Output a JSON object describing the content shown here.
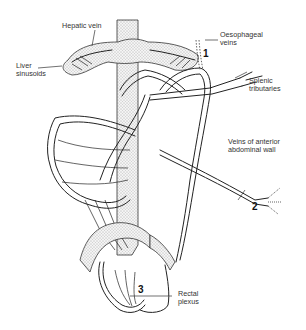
{
  "figure": {
    "labels": {
      "hepatic_vein": "Hepatic vein",
      "liver_sinusoids": "Liver\nsinusoids",
      "oesophageal_veins": "Oesophageal\nveins",
      "splenic_tributaries": "Splenic\ntributaries",
      "anterior_abdominal_wall": "Veins of anterior\nabdominal wall",
      "rectal_plexus": "Rectal\nplexus"
    },
    "site_numbers": {
      "oesophageal": "1",
      "abdominal_wall": "2",
      "rectal": "3"
    },
    "colors": {
      "line": "#222222",
      "background": "#ffffff",
      "stipple": "#555555"
    }
  }
}
